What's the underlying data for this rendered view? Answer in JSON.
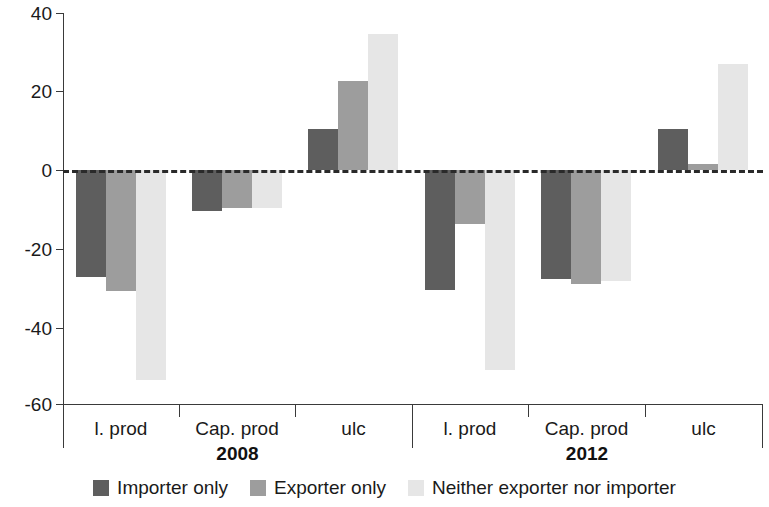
{
  "chart_data": {
    "type": "bar",
    "title": "",
    "subtitle": "",
    "xlabel": "",
    "ylabel": "",
    "ylim": [
      -60,
      40
    ],
    "yticks": [
      40,
      20,
      0,
      -20,
      -40,
      -60
    ],
    "ytick_labels": [
      "40",
      "20",
      "0",
      "-20",
      "-40",
      "-60"
    ],
    "grid": false,
    "zero_line": true,
    "legend_position": "bottom",
    "categories": [
      "l. prod",
      "Cap. prod",
      "ulc",
      "l. prod",
      "Cap. prod",
      "ulc"
    ],
    "groups": [
      {
        "label": "2008",
        "categories": [
          "l. prod",
          "Cap. prod",
          "ulc"
        ]
      },
      {
        "label": "2012",
        "categories": [
          "l. prod",
          "Cap. prod",
          "ulc"
        ]
      }
    ],
    "series": [
      {
        "name": "Importer only",
        "color": "#5e5e5e",
        "values": [
          -27.3,
          -10.6,
          10.4,
          -30.6,
          -27.8,
          10.6
        ]
      },
      {
        "name": "Exporter only",
        "color": "#9d9d9d",
        "values": [
          -30.9,
          -9.6,
          22.8,
          -13.7,
          -29.1,
          1.5
        ]
      },
      {
        "name": "Neither exporter nor importer",
        "color": "#e6e6e6",
        "values": [
          -53.7,
          -9.6,
          34.7,
          -51.1,
          -28.4,
          27.1
        ]
      }
    ],
    "legend": [
      {
        "label": "Importer only",
        "color": "#5e5e5e",
        "swatch": "dark"
      },
      {
        "label": "Exporter only",
        "color": "#9d9d9d",
        "swatch": "medium"
      },
      {
        "label": "Neither exporter nor importer",
        "color": "#e6e6e6",
        "swatch": "light"
      }
    ]
  },
  "axis": {
    "y_labels": [
      "40",
      "20",
      "0",
      "-20",
      "-40",
      "-60"
    ]
  },
  "x_axis": {
    "cat_labels": [
      "l. prod",
      "Cap. prod",
      "ulc",
      "l. prod",
      "Cap. prod",
      "ulc"
    ],
    "group_labels": [
      "2008",
      "2012"
    ]
  },
  "legend": {
    "items": [
      {
        "label": "Importer only"
      },
      {
        "label": "Exporter only"
      },
      {
        "label": "Neither exporter nor importer"
      }
    ]
  }
}
